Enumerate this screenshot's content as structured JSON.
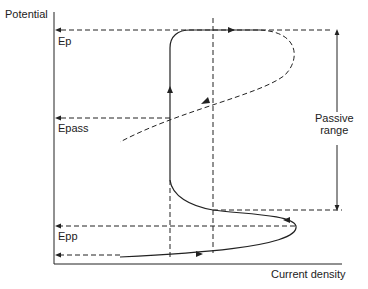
{
  "diagram": {
    "axes": {
      "y_label": "Potential",
      "x_label": "Current density"
    },
    "levels": [
      {
        "id": "ep",
        "label": "Ep"
      },
      {
        "id": "epass",
        "label": "Epass"
      },
      {
        "id": "epp",
        "label": "Epp"
      }
    ],
    "annotations": {
      "passive_range_line1": "Passive",
      "passive_range_line2": "range"
    },
    "colors": {
      "line": "#222222",
      "background": "#ffffff"
    }
  }
}
